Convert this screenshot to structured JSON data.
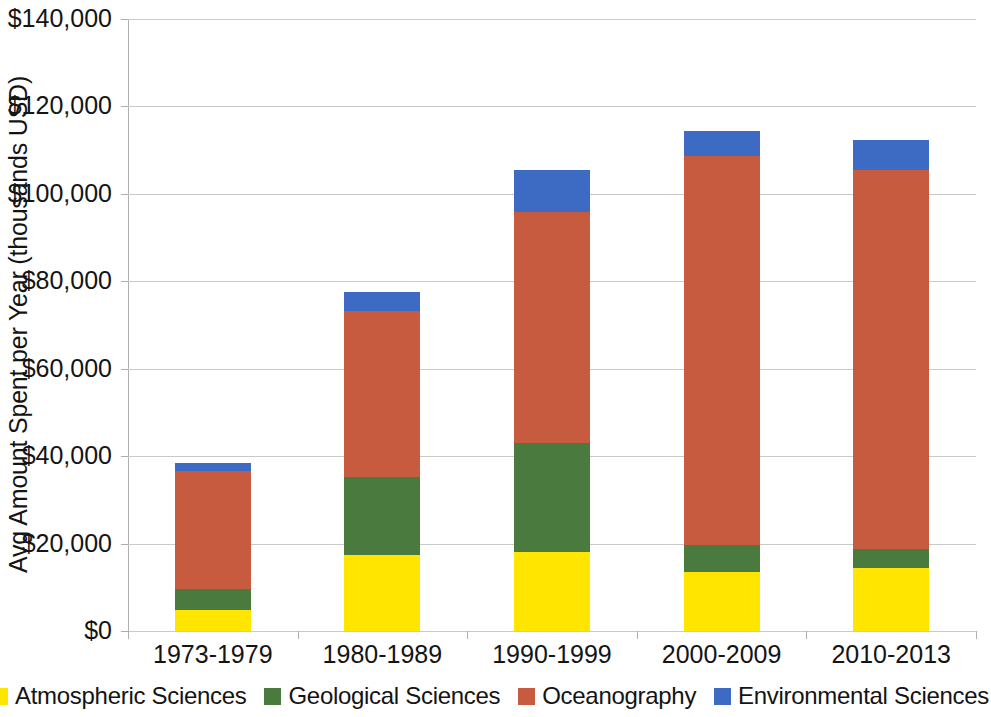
{
  "chart_data": {
    "type": "bar",
    "subtype": "stacked-vertical",
    "title": "",
    "xlabel": "",
    "ylabel": "Avg Amount Spent per Year (thousands USD)",
    "categories": [
      "1973-1979",
      "1980-1989",
      "1990-1999",
      "2000-2009",
      "2010-2013"
    ],
    "series": [
      {
        "name": "Atmospheric Sciences",
        "color": "#ffe500",
        "values": [
          4800,
          17400,
          18100,
          13500,
          14400
        ]
      },
      {
        "name": "Geological Sciences",
        "color": "#4a7a3e",
        "values": [
          4800,
          17900,
          25000,
          6200,
          4400
        ]
      },
      {
        "name": "Oceanography",
        "color": "#c75b40",
        "values": [
          27000,
          38000,
          52800,
          88900,
          86600
        ]
      },
      {
        "name": "Environmental Sciences",
        "color": "#3d6bc4",
        "values": [
          1800,
          4200,
          9600,
          5700,
          7000
        ]
      }
    ],
    "totals": [
      38400,
      77500,
      105500,
      114300,
      112400
    ],
    "ylim": [
      0,
      140000
    ],
    "ytick_values": [
      0,
      20000,
      40000,
      60000,
      80000,
      100000,
      120000,
      140000
    ],
    "ytick_labels": [
      "$0",
      "$20,000",
      "$40,000",
      "$60,000",
      "$80,000",
      "$100,000",
      "$120,000",
      "$140,000"
    ],
    "gridlines": true,
    "legend_position": "bottom",
    "axis_color": "#b0b0b0",
    "grid_color": "#c9c9c9",
    "background": "#ffffff"
  }
}
